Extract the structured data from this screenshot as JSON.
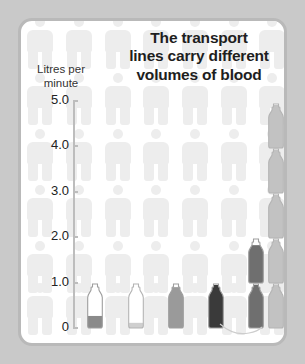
{
  "card": {
    "background_color": "#ffffff",
    "border_color": "#b9b9b9",
    "page_background_color": "#c9c9c9"
  },
  "title": {
    "line1": "The transport",
    "line2": "lines carry different",
    "line3": "volumes of blood",
    "full": "The transport lines carry different volumes of blood"
  },
  "axis": {
    "title_line1": "Litres per",
    "title_line2": "minute",
    "ticks": [
      "5.0",
      "4.0",
      "3.0",
      "2.0",
      "1.0",
      "0"
    ]
  },
  "chart_data": {
    "type": "bar",
    "title": "The transport lines carry different volumes of blood",
    "xlabel": "",
    "ylabel": "Litres per minute",
    "ylim": [
      0,
      5.0
    ],
    "yticks": [
      0,
      1.0,
      2.0,
      3.0,
      4.0,
      5.0
    ],
    "grid": false,
    "legend": "none",
    "categories": [
      "1",
      "2",
      "3",
      "4",
      "5",
      "6"
    ],
    "values": [
      0.25,
      0.1,
      0.85,
      0.9,
      1.75,
      5.0
    ],
    "units": "litres per minute",
    "bar_style": "stacked-bottle-pictogram",
    "bars": [
      {
        "index": 1,
        "value": 0.25,
        "fill_color": "#8a8a8a",
        "bottle_count": 1,
        "filled_fraction": 0.28
      },
      {
        "index": 2,
        "value": 0.1,
        "fill_color": "#cfcfcf",
        "bottle_count": 1,
        "filled_fraction": 0.12
      },
      {
        "index": 3,
        "value": 0.85,
        "fill_color": "#9a9a9a",
        "bottle_count": 1,
        "filled_fraction": 0.95
      },
      {
        "index": 4,
        "value": 0.9,
        "fill_color": "#3a3a3a",
        "bottle_count": 1,
        "filled_fraction": 1.0
      },
      {
        "index": 5,
        "value": 1.75,
        "fill_color": "#6f6f6f",
        "bottle_count": 2,
        "filled_fraction": 0.88
      },
      {
        "index": 6,
        "value": 5.0,
        "fill_color": "#c2c2c2",
        "bottle_count": 5,
        "filled_fraction": 1.0
      }
    ]
  },
  "colors": {
    "person_pictogram": "#ededed",
    "axis": "#bdbdbd",
    "text": "#222222",
    "title_text": "#1e1e1e"
  }
}
